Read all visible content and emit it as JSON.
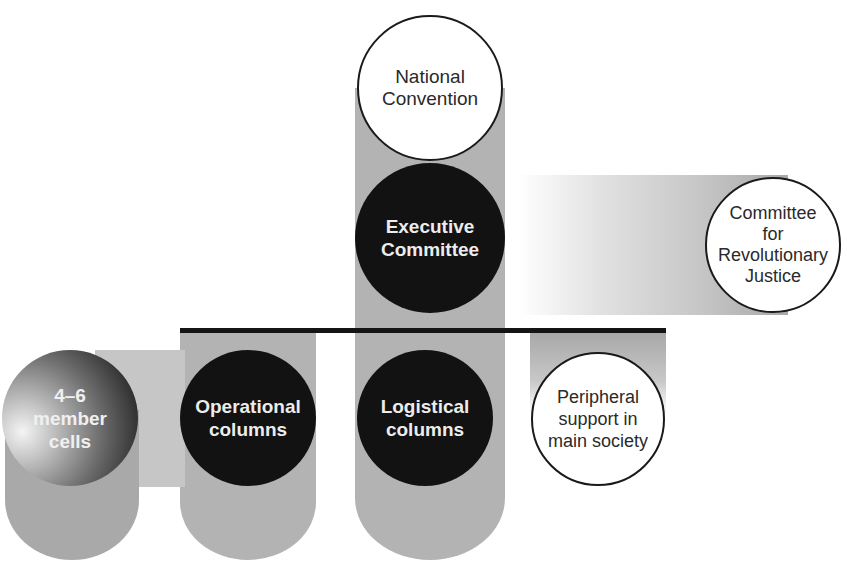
{
  "diagram": {
    "type": "organizational-structure",
    "nodes": {
      "national_convention": {
        "lines": [
          "National",
          "Convention"
        ],
        "style": "white"
      },
      "executive_committee": {
        "lines": [
          "Executive",
          "Committee"
        ],
        "style": "black"
      },
      "revolutionary_justice": {
        "lines": [
          "Committee",
          "for",
          "Revolutionary",
          "Justice"
        ],
        "style": "white"
      },
      "operational_columns": {
        "lines": [
          "Operational",
          "columns"
        ],
        "style": "black"
      },
      "logistical_columns": {
        "lines": [
          "Logistical",
          "columns"
        ],
        "style": "black"
      },
      "peripheral_support": {
        "lines": [
          "Peripheral",
          "support in",
          "main society"
        ],
        "style": "white"
      },
      "member_cells": {
        "lines": [
          "4–6",
          "member",
          "cells"
        ],
        "style": "gradient"
      }
    },
    "edges": [
      {
        "from": "national_convention",
        "to": "executive_committee"
      },
      {
        "from": "executive_committee",
        "to": "revolutionary_justice"
      },
      {
        "from": "executive_committee",
        "to": "operational_columns"
      },
      {
        "from": "executive_committee",
        "to": "logistical_columns"
      },
      {
        "from": "executive_committee",
        "to": "peripheral_support"
      },
      {
        "from": "operational_columns",
        "to": "member_cells"
      }
    ],
    "colors": {
      "column_gray": "#b3b3b3",
      "node_black": "#121212",
      "node_white": "#ffffff",
      "bar_black": "#141414"
    }
  }
}
